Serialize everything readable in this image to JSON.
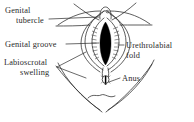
{
  "figure": {
    "type": "anatomical-line-drawing",
    "background_color": "#ffffff",
    "ink_color": "#2a2a2a",
    "fill_color": "#000000"
  },
  "labels": {
    "genital_tubercle": {
      "line1": "Genital",
      "line2": "tubercle"
    },
    "genital_groove": {
      "line1": "Genital groove"
    },
    "labioscrotal_swelling": {
      "line1": "Labioscrotal",
      "line2": "swelling"
    },
    "urethrolabial_fold": {
      "line1": "Urethrolabial",
      "line2": "fold"
    },
    "anus": {
      "line1": "Anus"
    }
  },
  "structures": [
    {
      "name": "genital-tubercle",
      "description": "small rounded knob at superior midline"
    },
    {
      "name": "genital-groove",
      "description": "solid black vertical slit at center"
    },
    {
      "name": "urethrolabial-fold",
      "description": "ridged inner folds flanking the groove"
    },
    {
      "name": "labioscrotal-swelling",
      "description": "outer almond-shaped swellings"
    },
    {
      "name": "anus",
      "description": "small oval opening inferior to perineum"
    },
    {
      "name": "thigh-contour",
      "description": "sweeping lines of inner thighs and buttocks"
    }
  ]
}
